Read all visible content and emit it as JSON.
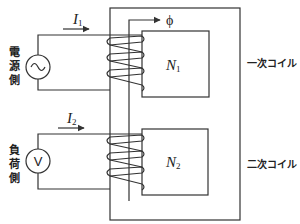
{
  "diagram": {
    "colors": {
      "line": "#333333",
      "background": "#ffffff"
    },
    "primary": {
      "side_label": [
        "電",
        "源",
        "側"
      ],
      "current_label": "I",
      "current_sub": "1",
      "turns_label": "N",
      "turns_sub": "1",
      "coil_label": "一次コイル",
      "source_symbol": "~",
      "source_icon": "ac-source-icon"
    },
    "secondary": {
      "side_label": [
        "負",
        "荷",
        "側"
      ],
      "current_label": "I",
      "current_sub": "2",
      "turns_label": "N",
      "turns_sub": "2",
      "coil_label": "二次コイル",
      "meter_symbol": "V",
      "meter_icon": "voltmeter-icon"
    },
    "flux_label": "ϕ"
  }
}
